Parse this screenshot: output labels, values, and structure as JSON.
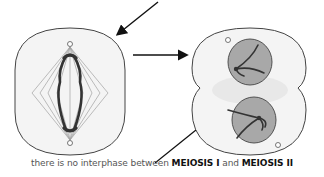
{
  "diagram": {
    "cells": [
      {
        "id": "cell-meiosis-1-spindle",
        "description": "Cell with spindle apparatus and separating chromosomes (end of meiosis I)"
      },
      {
        "id": "cell-meiosis-2-dividing",
        "description": "Cell dividing into two with chromosomes in each daughter region"
      }
    ],
    "arrows": [
      {
        "id": "arrow-top-into-left-cell",
        "from": "top-right",
        "to": "left cell"
      },
      {
        "id": "arrow-left-to-right-cell",
        "from": "left cell",
        "to": "right cell"
      },
      {
        "id": "arrow-caption-to-right-cell",
        "from": "caption",
        "to": "right cell"
      }
    ],
    "colors": {
      "cell_fill": "#f2f2f2",
      "cell_outline": "#444444",
      "nucleus_fill": "#a8a8a8",
      "chromosome": "#333333",
      "spindle": "#999999"
    }
  },
  "caption": {
    "prefix": "there is no interphase between ",
    "term1": "MEIOSIS I",
    "middle": " and ",
    "term2": "MEIOSIS II"
  }
}
